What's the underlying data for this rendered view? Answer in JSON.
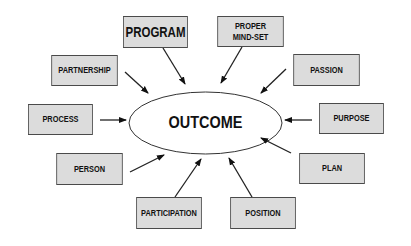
{
  "diagram": {
    "center": {
      "label": "OUTCOME"
    },
    "nodes": [
      {
        "id": "program",
        "label": "PROGRAM",
        "x": 116,
        "y": 16,
        "w": 79,
        "h": 32,
        "big": true
      },
      {
        "id": "proper-mind-set",
        "label": "PROPER\nMIND-SET",
        "x": 210,
        "y": 16,
        "w": 81,
        "h": 31
      },
      {
        "id": "partnership",
        "label": "PARTNERSHIP",
        "x": 44,
        "y": 55,
        "w": 81,
        "h": 31
      },
      {
        "id": "passion",
        "label": "PASSION",
        "x": 286,
        "y": 54,
        "w": 81,
        "h": 32
      },
      {
        "id": "process",
        "label": "PROCESS",
        "x": 21,
        "y": 104,
        "w": 79,
        "h": 31
      },
      {
        "id": "purpose",
        "label": "PURPOSE",
        "x": 312,
        "y": 103,
        "w": 79,
        "h": 31
      },
      {
        "id": "person",
        "label": "PERSON",
        "x": 49,
        "y": 153,
        "w": 81,
        "h": 32
      },
      {
        "id": "plan",
        "label": "PLAN",
        "x": 292,
        "y": 153,
        "w": 80,
        "h": 31
      },
      {
        "id": "participation",
        "label": "PARTICIPATION",
        "x": 129,
        "y": 197,
        "w": 80,
        "h": 32
      },
      {
        "id": "position",
        "label": "POSITION",
        "x": 223,
        "y": 197,
        "w": 80,
        "h": 32
      }
    ],
    "edges": [
      {
        "from": "program",
        "x1": 163,
        "y1": 48,
        "x2": 185,
        "y2": 84
      },
      {
        "from": "proper-mind-set",
        "x1": 242,
        "y1": 47,
        "x2": 221,
        "y2": 83
      },
      {
        "from": "partnership",
        "x1": 125,
        "y1": 72,
        "x2": 148,
        "y2": 93
      },
      {
        "from": "passion",
        "x1": 286,
        "y1": 69,
        "x2": 261,
        "y2": 93
      },
      {
        "from": "process",
        "x1": 100,
        "y1": 120,
        "x2": 126,
        "y2": 120
      },
      {
        "from": "purpose",
        "x1": 312,
        "y1": 120,
        "x2": 285,
        "y2": 120
      },
      {
        "from": "person",
        "x1": 130,
        "y1": 172,
        "x2": 164,
        "y2": 155
      },
      {
        "from": "plan",
        "x1": 291,
        "y1": 153,
        "x2": 261,
        "y2": 138
      },
      {
        "from": "participation",
        "x1": 175,
        "y1": 197,
        "x2": 201,
        "y2": 159
      },
      {
        "from": "position",
        "x1": 252,
        "y1": 197,
        "x2": 229,
        "y2": 158
      }
    ],
    "colors": {
      "box_fill": "#dcdcdc",
      "box_border": "#4a4a4a",
      "text": "#111111",
      "line": "#222222"
    }
  }
}
